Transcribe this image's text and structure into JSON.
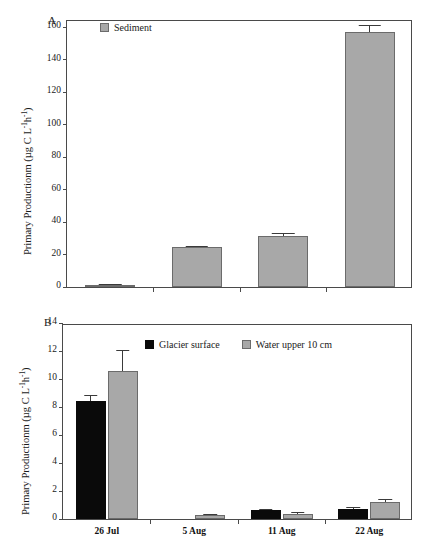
{
  "chart_data": [
    {
      "type": "bar",
      "panel": "A",
      "panel_label": "A",
      "title": "",
      "xlabel": "",
      "ylabel": "Primary Productionm (µg C L⁻¹h⁻¹)",
      "ylabel_main": "Primary Productionm (µg C L",
      "ylabel_sup1": "-1",
      "ylabel_mid": "h",
      "ylabel_sup2": "-1",
      "ylabel_end": ")",
      "ylim": [
        0,
        165
      ],
      "yticks": [
        0,
        20,
        40,
        60,
        80,
        100,
        120,
        140,
        160
      ],
      "ytick_labels": [
        "0",
        "20",
        "40",
        "60",
        "80",
        "100",
        "120",
        "140",
        "160"
      ],
      "categories": [
        "",
        "",
        "",
        ""
      ],
      "xtick_labels": [
        "",
        "",
        "",
        ""
      ],
      "grid": false,
      "frame": true,
      "legend_position": "top-left",
      "series": [
        {
          "name": "Sediment",
          "color": "#a8a8a8",
          "values": [
            1.2,
            24.8,
            31.5,
            157.0
          ],
          "errors": [
            0.6,
            0.7,
            1.6,
            4.5
          ]
        }
      ]
    },
    {
      "type": "bar",
      "panel": "B",
      "panel_label": "B",
      "title": "",
      "xlabel": "",
      "ylabel": "Primary Productionm (µg C L⁻¹h⁻¹)",
      "ylabel_main": "Primary Productionm (µg C L",
      "ylabel_sup1": "-1",
      "ylabel_mid": "h",
      "ylabel_sup2": "-1",
      "ylabel_end": ")",
      "ylim": [
        0,
        14
      ],
      "yticks": [
        0,
        2,
        4,
        6,
        8,
        10,
        12,
        14
      ],
      "ytick_labels": [
        "0",
        "2",
        "4",
        "6",
        "8",
        "10",
        "12",
        "14"
      ],
      "categories": [
        "26 Jul",
        "5 Aug",
        "11 Aug",
        "22 Aug"
      ],
      "xtick_labels": [
        "26 Jul",
        "5 Aug",
        "11 Aug",
        "22 Aug"
      ],
      "grid": false,
      "frame": true,
      "legend_position": "top-center",
      "series": [
        {
          "name": "Glacier surface",
          "color": "#0a0a0a",
          "values": [
            8.4,
            0.0,
            0.65,
            0.7
          ],
          "errors": [
            0.45,
            0.0,
            0.09,
            0.15
          ]
        },
        {
          "name": "Water upper 10 cm",
          "color": "#a8a8a8",
          "values": [
            10.6,
            0.28,
            0.38,
            1.22
          ],
          "errors": [
            1.5,
            0.07,
            0.14,
            0.2
          ]
        }
      ]
    }
  ],
  "colors": {
    "sediment": "#a8a8a8",
    "glacier_surface": "#0a0a0a",
    "water_upper": "#a8a8a8",
    "axis": "#4a4a4a",
    "text": "#1a1a1a",
    "background": "#ffffff"
  }
}
